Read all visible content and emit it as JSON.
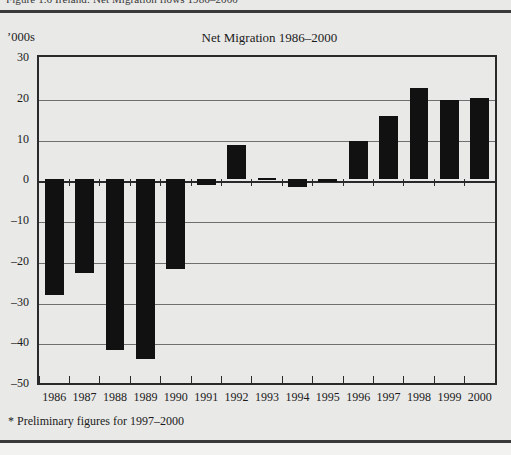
{
  "figure": {
    "caption_top": "Figure 1.6  Ireland: Net Migration flows 1986–2000",
    "units_label": "’000s",
    "footnote": "* Preliminary figures for 1997–2000"
  },
  "chart_data": {
    "type": "bar",
    "title": "Net Migration 1986–2000",
    "xlabel": "",
    "ylabel": "’000s",
    "ylim": [
      -50,
      30
    ],
    "yticks": [
      30,
      20,
      10,
      0,
      -10,
      -20,
      -30,
      -40,
      -50
    ],
    "ytick_labels": [
      "30",
      "20",
      "10",
      "0",
      "–10",
      "–20",
      "–30",
      "–40",
      "–50"
    ],
    "grid": true,
    "legend": false,
    "bar_color": "#111111",
    "categories": [
      "1986",
      "1987",
      "1988",
      "1989",
      "1990",
      "1991",
      "1992",
      "1993",
      "1994",
      "1995",
      "1996",
      "1997",
      "1998",
      "1999",
      "2000"
    ],
    "values": [
      -28.5,
      -23.0,
      -42.0,
      -44.0,
      -22.0,
      -1.5,
      8.5,
      0.3,
      -1.8,
      -0.6,
      9.5,
      15.5,
      22.5,
      19.5,
      20.0
    ]
  }
}
